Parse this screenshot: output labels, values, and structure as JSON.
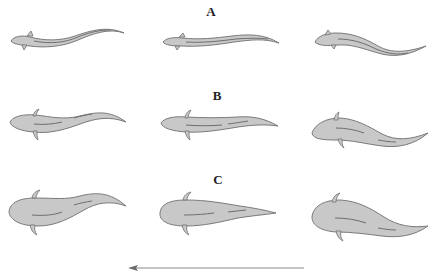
{
  "figure": {
    "type": "swimming-sequence-diagram",
    "rows": [
      {
        "label": "A",
        "description": "eel-like elongated body, three undulation phases"
      },
      {
        "label": "B",
        "description": "intermediate body with limb buds, three undulation phases"
      },
      {
        "label": "C",
        "description": "wider body with limbs, three undulation phases"
      }
    ],
    "frames_per_row": 3,
    "direction_arrow": {
      "direction": "left",
      "meaning": "swimming direction"
    },
    "colors": {
      "body_fill": "#c8c8c8",
      "outline": "#7a7a7a",
      "arrow": "#8a8a8a",
      "background": "#ffffff"
    }
  }
}
